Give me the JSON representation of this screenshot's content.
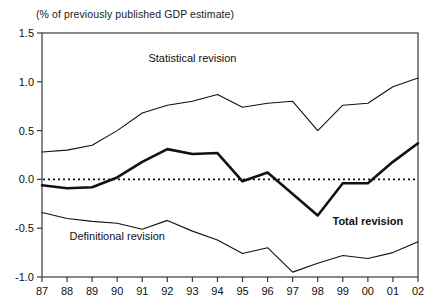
{
  "chart_data": {
    "type": "line",
    "title": "",
    "subtitle": "(% of previously published GDP estimate)",
    "xlabel": "",
    "ylabel": "",
    "xlim_categories": [
      "87",
      "88",
      "89",
      "90",
      "91",
      "92",
      "93",
      "94",
      "95",
      "96",
      "97",
      "98",
      "99",
      "00",
      "01",
      "02"
    ],
    "categories": [
      "87",
      "88",
      "89",
      "90",
      "91",
      "92",
      "93",
      "94",
      "95",
      "96",
      "97",
      "98",
      "99",
      "00",
      "01",
      "02"
    ],
    "ylim": [
      -1.0,
      1.5
    ],
    "yticks": [
      "1.5",
      "1.0",
      "0.5",
      "0.0",
      "-0.5",
      "-1.0"
    ],
    "ytick_values": [
      1.5,
      1.0,
      0.5,
      0.0,
      -0.5,
      -1.0
    ],
    "grid": false,
    "legend": "inline-annotations",
    "zero_line": {
      "value": 0.0,
      "style": "dotted"
    },
    "series": [
      {
        "name": "Statistical revision",
        "style": "thin",
        "color": "#111111",
        "label_x_category": "93",
        "label_y": 1.2,
        "values": [
          0.28,
          0.3,
          0.35,
          0.5,
          0.68,
          0.76,
          0.8,
          0.87,
          0.74,
          0.78,
          0.8,
          0.5,
          0.76,
          0.78,
          0.95,
          1.04
        ]
      },
      {
        "name": "Total revision",
        "style": "thick",
        "color": "#111111",
        "label_x_category": "00",
        "label_y": -0.47,
        "values": [
          -0.06,
          -0.09,
          -0.08,
          0.02,
          0.18,
          0.31,
          0.26,
          0.27,
          -0.02,
          0.07,
          -0.15,
          -0.37,
          -0.04,
          -0.04,
          0.18,
          0.37
        ]
      },
      {
        "name": "Definitional revision",
        "style": "thin",
        "color": "#111111",
        "label_x_category": "90",
        "label_y": -0.62,
        "values": [
          -0.34,
          -0.4,
          -0.43,
          -0.45,
          -0.51,
          -0.42,
          -0.53,
          -0.62,
          -0.76,
          -0.7,
          -0.95,
          -0.86,
          -0.78,
          -0.81,
          -0.75,
          -0.64
        ]
      }
    ]
  }
}
